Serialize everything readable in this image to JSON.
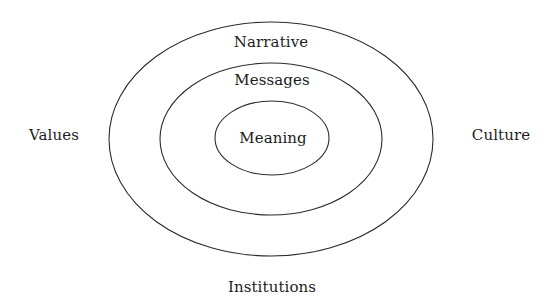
{
  "diagram": {
    "type": "concentric-ellipses",
    "background_color": "#ffffff",
    "stroke_color": "#2b2b2b",
    "text_color": "#1c1c1c",
    "rings": [
      {
        "name": "outer-ring",
        "label": "Narrative",
        "level": 3,
        "cx": 271,
        "cy": 139,
        "rx": 162,
        "ry": 117
      },
      {
        "name": "middle-ring",
        "label": "Messages",
        "level": 2,
        "cx": 271,
        "cy": 139,
        "rx": 111,
        "ry": 76
      },
      {
        "name": "inner-ring",
        "label": "Meaning",
        "level": 1,
        "cx": 272,
        "cy": 138,
        "rx": 57,
        "ry": 37
      }
    ],
    "outside_labels": [
      {
        "name": "left-label",
        "label": "Values",
        "position": "left"
      },
      {
        "name": "right-label",
        "label": "Culture",
        "position": "right"
      },
      {
        "name": "bottom-label",
        "label": "Institutions",
        "position": "bottom"
      }
    ]
  }
}
